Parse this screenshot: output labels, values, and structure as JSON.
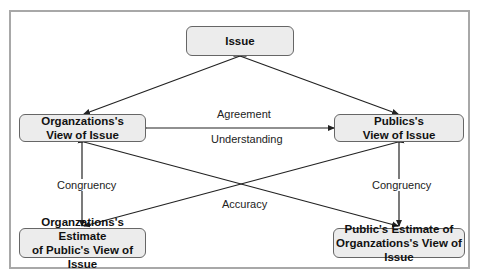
{
  "diagram": {
    "nodes": {
      "issue": "Issue",
      "org_view_l1": "Organzations's",
      "org_view_l2": "View of Issue",
      "pub_view_l1": "Publics's",
      "pub_view_l2": "View of Issue",
      "org_est_l1": "Organzations's Estimate",
      "org_est_l2": "of Public's View of Issue",
      "pub_est_l1": "Public's Estimate of",
      "pub_est_l2": "Organzations's View of Issue"
    },
    "edge_labels": {
      "agreement": "Agreement",
      "understanding": "Understanding",
      "congruency_left": "Congruency",
      "congruency_right": "Congruency",
      "accuracy": "Accuracy"
    },
    "colors": {
      "node_fill": "#ececec",
      "node_border": "#666666",
      "edge": "#222222",
      "frame": "#a8a8a8"
    }
  }
}
